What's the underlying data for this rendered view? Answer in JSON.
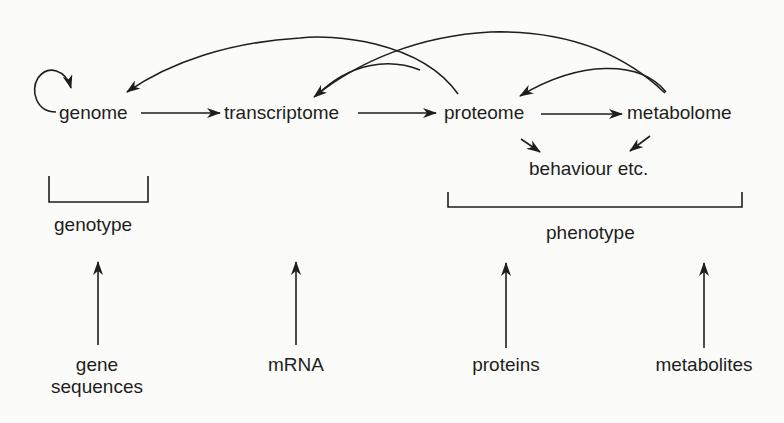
{
  "diagram": {
    "nodes": {
      "genome": "genome",
      "transcriptome": "transcriptome",
      "proteome": "proteome",
      "metabolome": "metabolome",
      "behaviour": "behaviour etc."
    },
    "groups": {
      "genotype": "genotype",
      "phenotype": "phenotype"
    },
    "inputs": {
      "gene_sequences": "gene\nsequences",
      "mrna": "mRNA",
      "proteins": "proteins",
      "metabolites": "metabolites"
    },
    "edges": [
      {
        "from": "genome",
        "to": "genome",
        "type": "self-loop"
      },
      {
        "from": "genome",
        "to": "transcriptome",
        "type": "straight"
      },
      {
        "from": "transcriptome",
        "to": "proteome",
        "type": "straight"
      },
      {
        "from": "proteome",
        "to": "metabolome",
        "type": "straight"
      },
      {
        "from": "proteome",
        "to": "genome",
        "type": "arc"
      },
      {
        "from": "proteome",
        "to": "transcriptome",
        "type": "arc"
      },
      {
        "from": "metabolome",
        "to": "transcriptome",
        "type": "arc"
      },
      {
        "from": "metabolome",
        "to": "proteome",
        "type": "arc"
      },
      {
        "from": "proteome",
        "to": "behaviour",
        "type": "straight"
      },
      {
        "from": "metabolome",
        "to": "behaviour",
        "type": "straight"
      },
      {
        "from": "gene_sequences",
        "to": "genotype",
        "type": "straight"
      },
      {
        "from": "mrna",
        "to": "phenotype-region",
        "type": "straight"
      },
      {
        "from": "proteins",
        "to": "phenotype",
        "type": "straight"
      },
      {
        "from": "metabolites",
        "to": "phenotype",
        "type": "straight"
      }
    ],
    "colors": {
      "ink": "#1e1e1e",
      "background": "#fbfbf9"
    }
  }
}
